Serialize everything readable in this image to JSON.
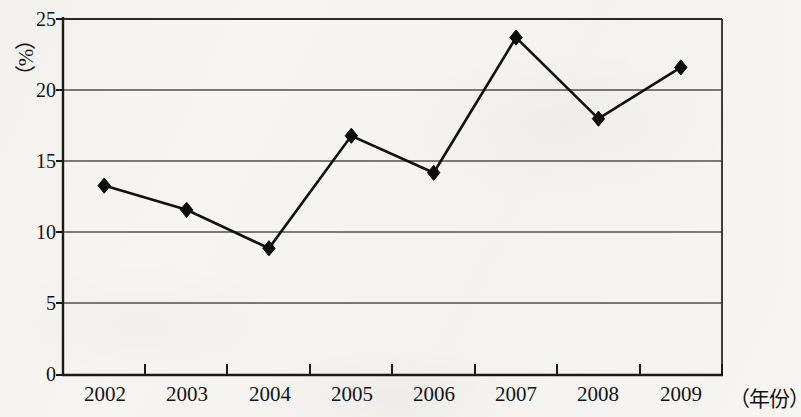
{
  "chart_data": {
    "type": "line",
    "title": "",
    "xlabel": "（年份）",
    "ylabel": "（%）",
    "categories": [
      "2002",
      "2003",
      "2004",
      "2005",
      "2006",
      "2007",
      "2008",
      "2009"
    ],
    "values": [
      13.3,
      11.6,
      8.9,
      16.8,
      14.2,
      23.7,
      18.0,
      21.6
    ],
    "series": [
      {
        "name": "",
        "values": [
          13.3,
          11.6,
          8.9,
          16.8,
          14.2,
          23.7,
          18.0,
          21.6
        ]
      }
    ],
    "ylim": [
      0,
      25
    ],
    "yticks": [
      "0",
      "5",
      "10",
      "15",
      "20",
      "25"
    ],
    "ytick_values": [
      0,
      5,
      10,
      15,
      20,
      25
    ],
    "grid": true,
    "gridlines_at": [
      5,
      10,
      15,
      20
    ],
    "legend": false,
    "legend_position": "none",
    "marker": "diamond",
    "line_color": "#111111",
    "marker_color": "#0d0d0d",
    "grid_color": "#5a5a5a",
    "axis_color": "#1a1a1a",
    "background_color": "#f6f5f2"
  },
  "axes": {
    "y_axis_label": "（%）",
    "x_axis_label": "（年份）",
    "y_tick_labels": [
      "25",
      "20",
      "15",
      "10",
      "5",
      "0"
    ],
    "x_tick_labels": [
      "2002",
      "2003",
      "2004",
      "2005",
      "2006",
      "2007",
      "2008",
      "2009"
    ]
  }
}
